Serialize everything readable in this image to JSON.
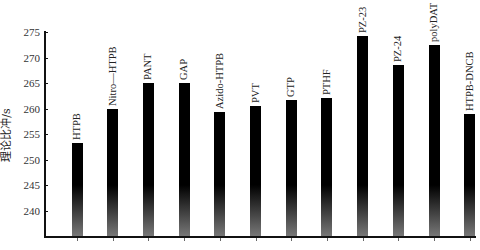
{
  "chart_data": {
    "type": "bar",
    "title": "",
    "xlabel": "",
    "ylabel": "理论比冲/s",
    "ylim": [
      235,
      275
    ],
    "yticks": [
      240,
      245,
      250,
      255,
      260,
      265,
      270,
      275
    ],
    "grid": false,
    "legend": null,
    "labels_position": "rotated above bars",
    "categories": [
      "HTPB",
      "Nitro—HTPB",
      "PANT",
      "GAP",
      "Azido-HTPB",
      "PVT",
      "GTP",
      "PTHF",
      "PZ-23",
      "PZ-24",
      "polyDAT",
      "HTPB-DNCB"
    ],
    "values": [
      253.2,
      260.0,
      265.0,
      265.0,
      259.4,
      260.4,
      261.7,
      262.1,
      274.2,
      268.5,
      272.5,
      259.0
    ]
  },
  "colors": {
    "bar_top": "#000000",
    "bar_bottom": "#777777",
    "axis": "#111111",
    "background": "#ffffff"
  }
}
